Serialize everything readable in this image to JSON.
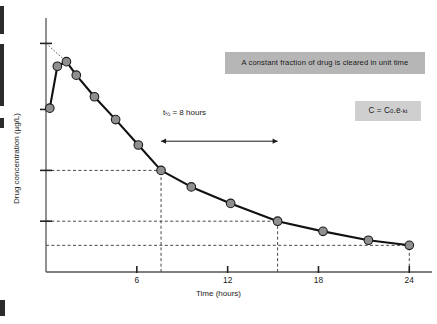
{
  "annotations": {
    "clearance_text": "A constant fraction of drug is cleared in unit time",
    "equation_prefix": "C = C",
    "equation_sub": "0",
    "equation_mid": ".e",
    "equation_sup": "-kt",
    "halflife_prefix": "t",
    "halflife_sub": "½",
    "halflife_rest": " = 8 hours",
    "ghost_text": ""
  },
  "chart_data": {
    "type": "line",
    "title": "",
    "subtitle": "",
    "xlabel": "Time (hours)",
    "ylabel": "Drug concentration (µg/L)",
    "xlim": [
      0,
      25.5
    ],
    "ylim": [
      0,
      10
    ],
    "grid": false,
    "legend": "none",
    "xticks": [
      6,
      12,
      18,
      24
    ],
    "xtick_labels": [
      "6",
      "12",
      "18",
      "24"
    ],
    "yticks": [
      9.0,
      6.4,
      4.0,
      2.0
    ],
    "ytick_labels": [
      "",
      "",
      "",
      ""
    ],
    "series": [
      {
        "name": "Drug concentration",
        "marker": "filled-circle",
        "marker_color": "#8f8f8f",
        "line_color": "#111111",
        "x": [
          0.25,
          0.75,
          1.35,
          2.0,
          3.2,
          4.6,
          6.1,
          7.6,
          9.6,
          12.2,
          15.3,
          18.3,
          21.3,
          24.0
        ],
        "y": [
          6.45,
          8.1,
          8.28,
          7.75,
          6.9,
          6.0,
          5.0,
          4.0,
          3.35,
          2.7,
          2.0,
          1.6,
          1.25,
          1.05
        ]
      }
    ],
    "extrapolation": {
      "label": "back-extrapolation to C0",
      "style": "dotted",
      "from": {
        "x": 0.0,
        "y": 9.0
      },
      "to": {
        "x": 1.35,
        "y": 8.28
      }
    },
    "reference_lines": [
      {
        "orientation": "horizontal",
        "y": 4.0,
        "style": "dashed",
        "from_x": 0.0,
        "to_x": 7.6
      },
      {
        "orientation": "horizontal",
        "y": 2.0,
        "style": "dashed",
        "from_x": 0.0,
        "to_x": 15.3
      },
      {
        "orientation": "horizontal",
        "y": 1.05,
        "style": "dashed",
        "from_x": 0.0,
        "to_x": 24.0
      },
      {
        "orientation": "vertical",
        "x": 7.6,
        "style": "dashed",
        "from_y": 0.0,
        "to_y": 4.0
      },
      {
        "orientation": "vertical",
        "x": 15.3,
        "style": "dashed",
        "from_y": 0.0,
        "to_y": 2.0
      },
      {
        "orientation": "vertical",
        "x": 24.0,
        "style": "dashed",
        "from_y": 0.0,
        "to_y": 1.05
      }
    ],
    "halflife_arrow": {
      "from_x": 7.6,
      "to_x": 15.3,
      "y_value": 5.15,
      "label": "t½ = 8 hours"
    },
    "notes": [
      "A constant fraction of drug is cleared in unit time",
      "C = C0.e-kt"
    ]
  }
}
